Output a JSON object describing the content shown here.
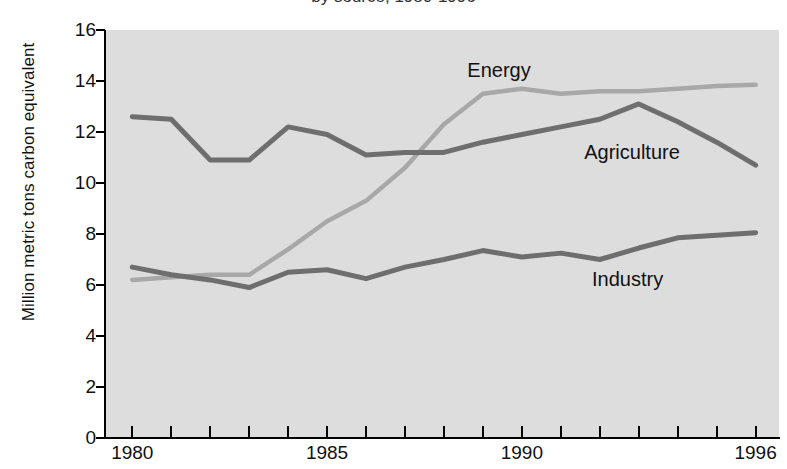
{
  "title_fragment": "by source, 1980-1996",
  "axis": {
    "ylabel": "Million metric tons carbon equivalent",
    "yticks": [
      "16",
      "14",
      "12",
      "10",
      "8",
      "6",
      "4",
      "2",
      "0"
    ],
    "xticks_labeled": [
      "1980",
      "1985",
      "1990",
      "1996"
    ]
  },
  "series_labels": {
    "energy": "Energy",
    "agriculture": "Agriculture",
    "industry": "Industry"
  },
  "colors": {
    "plot_background": "#dddddd",
    "axis": "#000000",
    "energy_line": "#a8a8a8",
    "agriculture_line": "#6e6e6e",
    "industry_line": "#6e6e6e",
    "text": "#111111"
  },
  "chart_data": {
    "type": "line",
    "title": "",
    "xlabel": "",
    "ylabel": "Million metric tons carbon equivalent",
    "xlim": [
      1979.3,
      1996.6
    ],
    "ylim": [
      0,
      16
    ],
    "ytick_values": [
      0,
      2,
      4,
      6,
      8,
      10,
      12,
      14,
      16
    ],
    "xtick_values": [
      1980,
      1981,
      1982,
      1983,
      1984,
      1985,
      1986,
      1987,
      1988,
      1989,
      1990,
      1991,
      1992,
      1993,
      1994,
      1995,
      1996
    ],
    "xtick_labeled": [
      1980,
      1985,
      1990,
      1996
    ],
    "grid": false,
    "legend": "inline-annotations",
    "x": [
      1980,
      1981,
      1982,
      1983,
      1984,
      1985,
      1986,
      1987,
      1988,
      1989,
      1990,
      1991,
      1992,
      1993,
      1994,
      1995,
      1996
    ],
    "series": [
      {
        "name": "Energy",
        "color": "#a8a8a8",
        "values": [
          6.2,
          6.3,
          6.4,
          6.4,
          7.4,
          8.5,
          9.3,
          10.6,
          12.3,
          13.5,
          13.7,
          13.5,
          13.6,
          13.6,
          13.7,
          13.8,
          13.85
        ]
      },
      {
        "name": "Agriculture",
        "color": "#6e6e6e",
        "values": [
          12.6,
          12.5,
          10.9,
          10.9,
          12.2,
          11.9,
          11.1,
          11.2,
          11.2,
          11.6,
          11.9,
          12.2,
          12.5,
          13.1,
          12.4,
          11.6,
          10.7
        ]
      },
      {
        "name": "Industry",
        "color": "#6e6e6e",
        "values": [
          6.7,
          6.4,
          6.2,
          5.9,
          6.5,
          6.6,
          6.25,
          6.7,
          7.0,
          7.35,
          7.1,
          7.25,
          7.0,
          7.45,
          7.85,
          7.95,
          8.05
        ]
      }
    ],
    "annotations": [
      {
        "text": "Energy",
        "x": 1988.6,
        "y": 14.35
      },
      {
        "text": "Agriculture",
        "x": 1991.6,
        "y": 11.15
      },
      {
        "text": "Industry",
        "x": 1991.8,
        "y": 6.15
      }
    ]
  }
}
